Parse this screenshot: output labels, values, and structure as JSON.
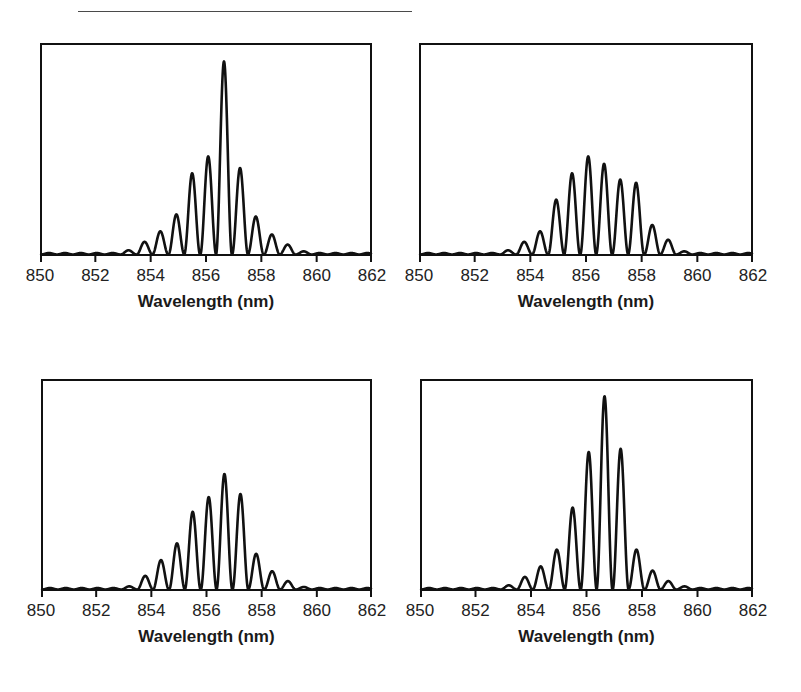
{
  "colors": {
    "line": "#111111",
    "axis": "#111111",
    "text": "#222222",
    "top_rule": "#4a4a4a"
  },
  "chart_data": [
    {
      "panel": "top-left",
      "type": "line",
      "title": "",
      "xlabel": "Wavelength (nm)",
      "ylabel": "",
      "xlim": [
        850,
        862
      ],
      "ylim": [
        0,
        1
      ],
      "xticks": [
        850,
        852,
        854,
        856,
        858,
        860,
        862
      ],
      "xtick_labels": [
        "850",
        "852",
        "854",
        "856",
        "858",
        "860",
        "862"
      ],
      "yticks": [],
      "grid": false,
      "legend": null,
      "fringe_spacing_nm": 0.575,
      "baseline_ripple": 0.007,
      "peaks": {
        "x": [
          853.2,
          853.78,
          854.35,
          854.93,
          855.5,
          856.08,
          856.65,
          857.23,
          857.8,
          858.38,
          858.95,
          859.53
        ],
        "y": [
          0.02,
          0.06,
          0.11,
          0.19,
          0.385,
          0.465,
          0.915,
          0.41,
          0.18,
          0.095,
          0.047,
          0.015
        ]
      }
    },
    {
      "panel": "top-right",
      "type": "line",
      "title": "",
      "xlabel": "Wavelength (nm)",
      "ylabel": "",
      "xlim": [
        850,
        862
      ],
      "ylim": [
        0,
        1
      ],
      "xticks": [
        850,
        852,
        854,
        856,
        858,
        860,
        862
      ],
      "xtick_labels": [
        "850",
        "852",
        "854",
        "856",
        "858",
        "860",
        "862"
      ],
      "yticks": [],
      "grid": false,
      "legend": null,
      "fringe_spacing_nm": 0.575,
      "baseline_ripple": 0.007,
      "peaks": {
        "x": [
          853.2,
          853.78,
          854.35,
          854.93,
          855.5,
          856.08,
          856.65,
          857.23,
          857.8,
          858.38,
          858.95,
          859.53
        ],
        "y": [
          0.02,
          0.06,
          0.11,
          0.26,
          0.385,
          0.465,
          0.43,
          0.355,
          0.34,
          0.14,
          0.07,
          0.015
        ]
      }
    },
    {
      "panel": "bottom-left",
      "type": "line",
      "title": "",
      "xlabel": "Wavelength (nm)",
      "ylabel": "",
      "xlim": [
        850,
        862
      ],
      "ylim": [
        0,
        1
      ],
      "xticks": [
        850,
        852,
        854,
        856,
        858,
        860,
        862
      ],
      "xtick_labels": [
        "850",
        "852",
        "854",
        "856",
        "858",
        "860",
        "862"
      ],
      "yticks": [],
      "grid": false,
      "legend": null,
      "fringe_spacing_nm": 0.575,
      "baseline_ripple": 0.007,
      "peaks": {
        "x": [
          853.2,
          853.78,
          854.35,
          854.93,
          855.5,
          856.08,
          856.65,
          857.23,
          857.8,
          858.38,
          858.95,
          859.53
        ],
        "y": [
          0.015,
          0.065,
          0.14,
          0.22,
          0.37,
          0.44,
          0.55,
          0.455,
          0.17,
          0.087,
          0.04,
          0.012
        ]
      }
    },
    {
      "panel": "bottom-right",
      "type": "line",
      "title": "",
      "xlabel": "Wavelength (nm)",
      "ylabel": "",
      "xlim": [
        850,
        862
      ],
      "ylim": [
        0,
        1
      ],
      "xticks": [
        850,
        852,
        854,
        856,
        858,
        860,
        862
      ],
      "xtick_labels": [
        "850",
        "852",
        "854",
        "856",
        "858",
        "860",
        "862"
      ],
      "yticks": [],
      "grid": false,
      "legend": null,
      "fringe_spacing_nm": 0.575,
      "baseline_ripple": 0.007,
      "peaks": {
        "x": [
          853.2,
          853.78,
          854.35,
          854.93,
          855.5,
          856.08,
          856.65,
          857.23,
          857.8,
          858.38,
          858.95,
          859.53
        ],
        "y": [
          0.02,
          0.06,
          0.11,
          0.19,
          0.39,
          0.655,
          0.92,
          0.67,
          0.19,
          0.09,
          0.04,
          0.015
        ]
      }
    }
  ]
}
